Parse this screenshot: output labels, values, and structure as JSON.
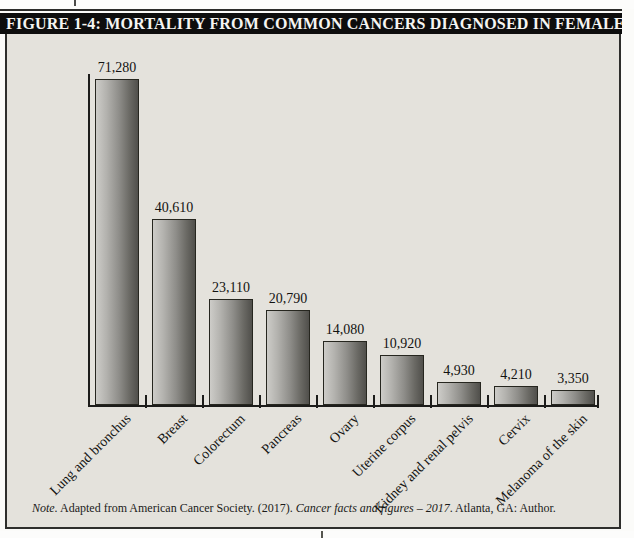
{
  "figure": {
    "title": "FIGURE 1-4: MORTALITY FROM COMMON CANCERS DIAGNOSED IN FEMALES",
    "note": {
      "label_italic": "Note.",
      "text_after_label": " Adapted from American Cancer Society. (2017). ",
      "cited_title_italic": "Cancer facts and figures – 2017",
      "text_after_title": ". Atlanta, GA: Author."
    }
  },
  "chart_data": {
    "type": "bar",
    "title": "FIGURE 1-4: MORTALITY FROM COMMON CANCERS DIAGNOSED IN FEMALES",
    "categories": [
      "Lung and bronchus",
      "Breast",
      "Colorectum",
      "Pancreas",
      "Ovary",
      "Uterine corpus",
      "Kidney and renal pelvis",
      "Cervix",
      "Melanoma of the skin"
    ],
    "values": [
      71280,
      40610,
      23110,
      20790,
      14080,
      10920,
      4930,
      4210,
      3350
    ],
    "value_labels": [
      "71,280",
      "40,610",
      "23,110",
      "20,790",
      "14,080",
      "10,920",
      "4,930",
      "4,210",
      "3,350"
    ],
    "xlabel": "",
    "ylabel": "",
    "ylim": [
      0,
      75000
    ],
    "grid": false,
    "legend": false,
    "bar_gradient": [
      "#cdccc8",
      "#8e8d89",
      "#504f4b"
    ],
    "axis_color": "#1c1c1a"
  },
  "colors": {
    "title_bar_bg": "#0d0d0d",
    "title_bar_text": "#f5f5f2",
    "figure_bg": "#e4e2dc",
    "page_bg": "#fbfbf9"
  }
}
